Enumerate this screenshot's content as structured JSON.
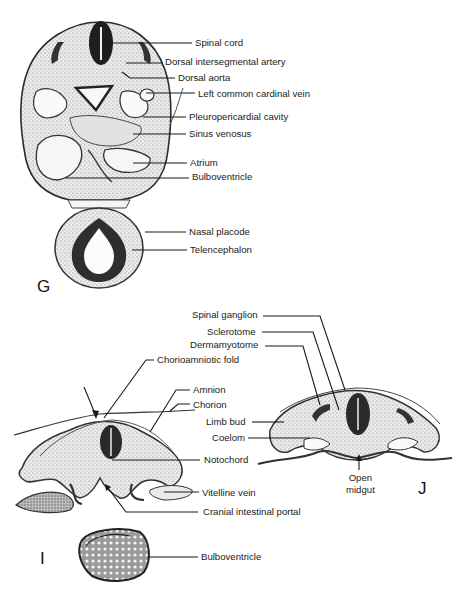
{
  "figure": {
    "panels": {
      "G": {
        "letter": "G",
        "labels": [
          {
            "id": "spinal-cord",
            "text": "Spinal cord",
            "x": 195,
            "y": 38
          },
          {
            "id": "dorsal-intersegmental-artery",
            "text": "Dorsal intersegmental artery",
            "x": 165,
            "y": 57
          },
          {
            "id": "dorsal-aorta",
            "text": "Dorsal aorta",
            "x": 178,
            "y": 73
          },
          {
            "id": "left-common-cardinal-vein",
            "text": "Left common cardinal vein",
            "x": 198,
            "y": 89
          },
          {
            "id": "pleuropericardial-cavity",
            "text": "Pleuropericardial cavity",
            "x": 189,
            "y": 112
          },
          {
            "id": "sinus-venosus",
            "text": "Sinus venosus",
            "x": 189,
            "y": 129
          },
          {
            "id": "atrium",
            "text": "Atrium",
            "x": 190,
            "y": 158
          },
          {
            "id": "bulboventricle",
            "text": "Bulboventricle",
            "x": 192,
            "y": 172
          },
          {
            "id": "nasal-placode",
            "text": "Nasal placode",
            "x": 189,
            "y": 227
          },
          {
            "id": "telencephalon",
            "text": "Telencephalon",
            "x": 190,
            "y": 245
          }
        ]
      },
      "I": {
        "letter": "I",
        "labels": [
          {
            "id": "chorioamniotic-fold",
            "text": "Chorioamniotic fold",
            "x": 157,
            "y": 355
          },
          {
            "id": "amnion",
            "text": "Amnion",
            "x": 193,
            "y": 385
          },
          {
            "id": "chorion",
            "text": "Chorion",
            "x": 193,
            "y": 400
          },
          {
            "id": "notochord",
            "text": "Notochord",
            "x": 204,
            "y": 455
          },
          {
            "id": "vitelline-vein",
            "text": "Vitelline vein",
            "x": 202,
            "y": 488
          },
          {
            "id": "cranial-intestinal-portal",
            "text": "Cranial intestinal portal",
            "x": 203,
            "y": 507
          },
          {
            "id": "bulboventricle-i",
            "text": "Bulboventricle",
            "x": 201,
            "y": 552
          }
        ]
      },
      "J": {
        "letter": "J",
        "labels": [
          {
            "id": "spinal-ganglion",
            "text": "Spinal ganglion",
            "x": 192,
            "y": 310
          },
          {
            "id": "sclerotome",
            "text": "Sclerotome",
            "x": 207,
            "y": 327
          },
          {
            "id": "dermamyotome",
            "text": "Dermamyotome",
            "x": 190,
            "y": 340
          },
          {
            "id": "limb-bud",
            "text": "Limb bud",
            "x": 206,
            "y": 417
          },
          {
            "id": "coelom",
            "text": "Coelom",
            "x": 212,
            "y": 433
          },
          {
            "id": "open-midgut",
            "text": "Open\nmidgut",
            "x": 346,
            "y": 467
          }
        ]
      }
    },
    "colors": {
      "ink": "#1a1a1a",
      "tissue": "#cfcfcf",
      "dark_tissue": "#2b2b2b",
      "background": "#ffffff"
    }
  }
}
